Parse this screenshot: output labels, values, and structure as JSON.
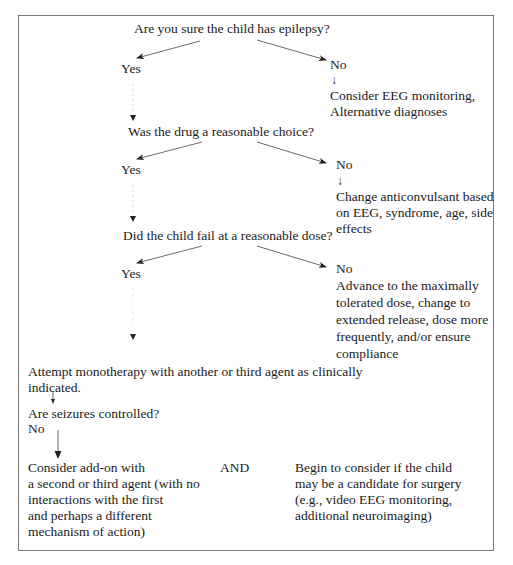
{
  "diagram": {
    "q1": {
      "question": "Are you sure the child has epilepsy?",
      "yes_label": "Yes",
      "no_label": "No",
      "no_arrow": "↓",
      "no_action_lines": [
        "Consider EEG monitoring,",
        "Alternative diagnoses"
      ]
    },
    "q2": {
      "question": "Was the drug a reasonable choice?",
      "yes_label": "Yes",
      "no_label": "No",
      "no_arrow": "↓",
      "no_action_lines": [
        "Change anticonvulsant based",
        "on EEG, syndrome, age, side",
        "effects"
      ]
    },
    "q3": {
      "question": "Did the child fail at a reasonable dose?",
      "yes_label": "Yes",
      "no_label": "No",
      "no_action_lines": [
        "Advance to the maximally",
        "tolerated dose, change to",
        "extended release, dose more",
        "frequently, and/or ensure",
        "compliance"
      ]
    },
    "monotherapy": {
      "lines": [
        "Attempt monotherapy with another or third agent as clinically",
        "indicated."
      ]
    },
    "q4": {
      "question": "Are seizures controlled?",
      "no_label": "No"
    },
    "final": {
      "left_lines": [
        "Consider add-on with",
        "a second or third agent (with no",
        "interactions with the first",
        "and perhaps a different",
        "mechanism of action)"
      ],
      "connector": "AND",
      "right_lines": [
        "Begin to consider if the child",
        "may be a candidate for surgery",
        "(e.g., video EEG monitoring,",
        "additional neuroimaging)"
      ]
    }
  }
}
